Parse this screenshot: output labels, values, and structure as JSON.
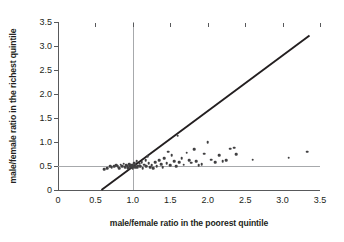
{
  "chart_data": {
    "type": "scatter",
    "title": "",
    "xlabel": "male/female ratio in the poorest quintile",
    "ylabel": "male/female ratio in the richest quintile",
    "xlim": [
      0,
      3.5
    ],
    "ylim": [
      0,
      3.5
    ],
    "xticks": [
      0,
      0.5,
      1.0,
      1.5,
      2.0,
      2.5,
      3.0,
      3.5
    ],
    "xticklabels": [
      "0",
      "0.5",
      "1.0",
      "1.5",
      "2.0",
      "2.5",
      "3.0",
      "3.5"
    ],
    "yticks": [
      0,
      0.5,
      1.0,
      1.5,
      2.0,
      2.5,
      3.0,
      3.5
    ],
    "yticklabels": [
      "0",
      "0.5",
      "1.0",
      "1.5",
      "2.0",
      "2.5",
      "3.0",
      "3.5"
    ],
    "grid": false,
    "legend": null,
    "marker_color": "#414042",
    "reference_lines": [
      {
        "name": "identity-line",
        "type": "diagonal",
        "from": [
          0.58,
          0.0
        ],
        "to": [
          3.36,
          3.22
        ],
        "color": "#231f20",
        "width": 1.9
      },
      {
        "name": "horizontal-reference",
        "type": "horizontal",
        "y": 0.5,
        "color": "#a7a9ac",
        "width": 1
      },
      {
        "name": "vertical-reference",
        "type": "vertical",
        "x": 1.0,
        "color": "#a7a9ac",
        "width": 1
      }
    ],
    "points": [
      [
        0.62,
        0.43
      ],
      [
        0.66,
        0.46
      ],
      [
        0.7,
        0.5
      ],
      [
        0.72,
        0.47
      ],
      [
        0.75,
        0.49
      ],
      [
        0.78,
        0.52
      ],
      [
        0.8,
        0.5
      ],
      [
        0.82,
        0.46
      ],
      [
        0.84,
        0.53
      ],
      [
        0.86,
        0.5
      ],
      [
        0.88,
        0.55
      ],
      [
        0.9,
        0.48
      ],
      [
        0.91,
        0.52
      ],
      [
        0.93,
        0.5
      ],
      [
        0.94,
        0.46
      ],
      [
        0.95,
        0.54
      ],
      [
        0.96,
        0.5
      ],
      [
        0.97,
        0.47
      ],
      [
        0.98,
        0.52
      ],
      [
        0.99,
        0.49
      ],
      [
        1.0,
        0.53
      ],
      [
        1.0,
        0.46
      ],
      [
        1.01,
        0.5
      ],
      [
        1.02,
        0.56
      ],
      [
        1.03,
        0.48
      ],
      [
        1.04,
        0.52
      ],
      [
        1.05,
        0.6
      ],
      [
        1.06,
        0.47
      ],
      [
        1.07,
        0.51
      ],
      [
        1.09,
        0.55
      ],
      [
        1.1,
        0.49
      ],
      [
        1.12,
        0.58
      ],
      [
        1.13,
        0.46
      ],
      [
        1.15,
        0.53
      ],
      [
        1.17,
        0.62
      ],
      [
        1.18,
        0.5
      ],
      [
        1.2,
        0.71
      ],
      [
        1.21,
        0.56
      ],
      [
        1.23,
        0.48
      ],
      [
        1.25,
        0.52
      ],
      [
        1.27,
        0.45
      ],
      [
        1.3,
        0.58
      ],
      [
        1.32,
        0.5
      ],
      [
        1.35,
        0.62
      ],
      [
        1.38,
        0.54
      ],
      [
        1.4,
        0.47
      ],
      [
        1.42,
        0.66
      ],
      [
        1.45,
        0.56
      ],
      [
        1.47,
        0.8
      ],
      [
        1.5,
        0.52
      ],
      [
        1.52,
        0.72
      ],
      [
        1.55,
        0.6
      ],
      [
        1.58,
        0.49
      ],
      [
        1.6,
        1.13
      ],
      [
        1.62,
        0.58
      ],
      [
        1.65,
        0.66
      ],
      [
        1.68,
        0.53
      ],
      [
        1.72,
        0.78
      ],
      [
        1.75,
        0.62
      ],
      [
        1.78,
        0.57
      ],
      [
        1.82,
        0.85
      ],
      [
        1.85,
        0.6
      ],
      [
        1.88,
        0.52
      ],
      [
        1.92,
        0.54
      ],
      [
        1.95,
        0.76
      ],
      [
        2.0,
        1.0
      ],
      [
        2.05,
        0.63
      ],
      [
        2.1,
        0.58
      ],
      [
        2.15,
        0.72
      ],
      [
        2.2,
        0.6
      ],
      [
        2.25,
        0.62
      ],
      [
        2.3,
        0.86
      ],
      [
        2.35,
        0.88
      ],
      [
        2.38,
        0.75
      ],
      [
        2.6,
        0.63
      ],
      [
        3.08,
        0.67
      ],
      [
        3.33,
        0.8
      ]
    ]
  }
}
